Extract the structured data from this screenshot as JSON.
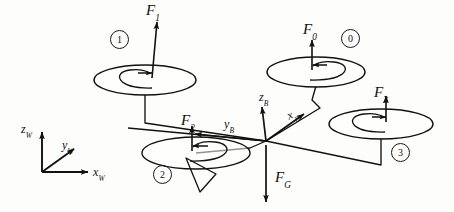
{
  "figure": {
    "background_color": "#fdfdfb",
    "stroke_color": "#111111"
  },
  "world_frame": {
    "origin": [
      42,
      172
    ],
    "axes": [
      {
        "id": "zW",
        "base": "z",
        "sub": "W",
        "label": "z_W",
        "direction": "up",
        "tip": [
          42,
          128
        ]
      },
      {
        "id": "yW",
        "base": "y",
        "sub": "W",
        "label": "y_W",
        "direction": "up-right",
        "tip": [
          76,
          146
        ]
      },
      {
        "id": "xW",
        "base": "x",
        "sub": "W",
        "label": "x_W",
        "direction": "right",
        "tip": [
          92,
          172
        ]
      }
    ]
  },
  "body_frame": {
    "origin": [
      266,
      141
    ],
    "axes": [
      {
        "id": "zB",
        "base": "z",
        "sub": "B",
        "label": "z_B",
        "direction": "up",
        "tip": [
          262,
          105
        ]
      },
      {
        "id": "yB",
        "base": "y",
        "sub": "B",
        "label": "y_B",
        "direction": "left",
        "tip": [
          190,
          133
        ]
      },
      {
        "id": "xB",
        "base": "x",
        "sub": "B",
        "label": "x_B",
        "direction": "up-right",
        "tip": [
          306,
          112
        ]
      }
    ]
  },
  "rotors": [
    {
      "id": "rotor-0",
      "number": "0",
      "force": {
        "base": "F",
        "sub": "0",
        "label": "F_0",
        "direction": "up"
      },
      "spin": "counterclockwise",
      "spin_arrow_direction": "left",
      "disc_center": [
        316,
        72
      ],
      "disc_rx": 49,
      "disc_ry": 15,
      "badge_pos": [
        348,
        36
      ],
      "force_label_pos": [
        304,
        26
      ]
    },
    {
      "id": "rotor-1",
      "number": "1",
      "force": {
        "base": "F",
        "sub": "1",
        "label": "F_1",
        "direction": "up"
      },
      "spin": "clockwise",
      "spin_arrow_direction": "right",
      "disc_center": [
        145,
        80
      ],
      "disc_rx": 51,
      "disc_ry": 15,
      "badge_pos": [
        118,
        38
      ],
      "force_label_pos": [
        146,
        4
      ]
    },
    {
      "id": "rotor-2",
      "number": "2",
      "force": {
        "base": "F",
        "sub": "2",
        "label": "F_2",
        "direction": "up"
      },
      "spin": "counterclockwise",
      "spin_arrow_direction": "left",
      "disc_center": [
        196,
        153
      ],
      "disc_rx": 54,
      "disc_ry": 16,
      "badge_pos": [
        160,
        169
      ],
      "force_label_pos": [
        182,
        116
      ]
    },
    {
      "id": "rotor-3",
      "number": "3",
      "force": {
        "base": "F",
        "sub": "3",
        "label": "F_3",
        "direction": "up"
      },
      "spin": "clockwise",
      "spin_arrow_direction": "right",
      "disc_center": [
        381,
        124
      ],
      "disc_rx": 52,
      "disc_ry": 15,
      "badge_pos": [
        397,
        146
      ],
      "force_label_pos": [
        375,
        89
      ]
    }
  ],
  "gravity": {
    "id": "gravity-force",
    "base": "F",
    "sub": "G",
    "label": "F_G",
    "direction": "down",
    "from": [
      266,
      145
    ],
    "to": [
      266,
      203
    ],
    "label_pos": [
      274,
      172
    ]
  },
  "arms": [
    {
      "id": "arm-rotor-0",
      "path": "M 316,86 L 312,100 L 320,108 L 266,141"
    },
    {
      "id": "arm-rotor-1",
      "path": "M 145,94 L 145,123 L 266,141"
    },
    {
      "id": "arm-rotor-2",
      "path": "M 196,153 L 252,148 L 266,141"
    },
    {
      "id": "arm-rotor-3",
      "path": "M 381,138 L 381,165 L 266,141"
    }
  ]
}
